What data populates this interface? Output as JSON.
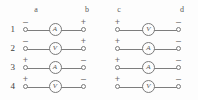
{
  "figure": {
    "column_labels": [
      "a",
      "b",
      "c",
      "d"
    ],
    "row_labels": [
      "1",
      "2",
      "3",
      "4"
    ],
    "wire_color": "#7d7d7d",
    "stroke_color": "#7a7a7a",
    "text_color": "#555555",
    "background": "#fdfdfd",
    "blocks": [
      {
        "name": "left-block",
        "left_column": "a",
        "right_column": "b",
        "rows": [
          {
            "row": "1",
            "left_sign": "–",
            "right_sign": "+",
            "meter": "A"
          },
          {
            "row": "2",
            "left_sign": "–",
            "right_sign": "+",
            "meter": "V"
          },
          {
            "row": "3",
            "left_sign": "+",
            "right_sign": "–",
            "meter": "A"
          },
          {
            "row": "4",
            "left_sign": "+",
            "right_sign": "–",
            "meter": "V"
          }
        ]
      },
      {
        "name": "right-block",
        "left_column": "c",
        "right_column": "d",
        "rows": [
          {
            "row": "1",
            "left_sign": "+",
            "right_sign": "–",
            "meter": "V"
          },
          {
            "row": "2",
            "left_sign": "+",
            "right_sign": "–",
            "meter": "A"
          },
          {
            "row": "3",
            "left_sign": "+",
            "right_sign": "–",
            "meter": "A"
          },
          {
            "row": "4",
            "left_sign": "+",
            "right_sign": "–",
            "meter": "V"
          }
        ]
      }
    ]
  }
}
